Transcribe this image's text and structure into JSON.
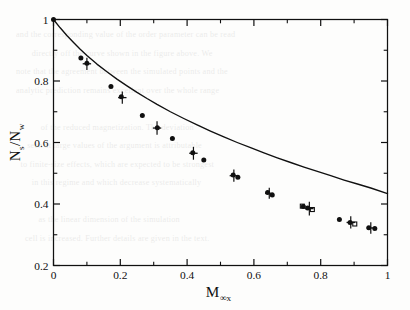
{
  "figure": {
    "background_color": "#fdfdfc",
    "ink_color": "#101010"
  },
  "ghost_text": "and the corresponding value of the order parameter can be read\n       directly off the curve shown in the figure above. We\nnote that the agreement between the simulated points and the\nanalytic prediction remains excellent over the whole range\n\n           of the reduced magnetization. The deviation\n     seen at large values of the argument is attributable\n  to finite-size effects, which are expected to be strongest\n       in this regime and which decrease systematically\n\n          as the linear dimension of the simulation\n    cell is increased. Further details are given in the text.",
  "chart_data": {
    "type": "line",
    "title": "",
    "xlabel": "M",
    "xlabel_sub": "∞x",
    "ylabel_numerator": "N",
    "ylabel_numerator_sub": "s",
    "ylabel_denominator": "N",
    "ylabel_denominator_sub": "w",
    "ylabel_full": "N_s/N_w",
    "xlim": [
      0,
      1
    ],
    "ylim": [
      0.2,
      1.0
    ],
    "x_major_ticks": [
      0,
      0.2,
      0.4,
      0.6,
      0.8,
      1
    ],
    "x_major_tick_labels": [
      "0",
      "0.2",
      "0.4",
      "0.6",
      "0.8",
      "1"
    ],
    "x_minor_ticks": [
      0.1,
      0.3,
      0.5,
      0.7,
      0.9
    ],
    "y_major_ticks": [
      0.2,
      0.4,
      0.6,
      0.8,
      1
    ],
    "y_major_tick_labels": [
      "0.2",
      "0.4",
      "0.6",
      "0.8",
      "1"
    ],
    "y_minor_ticks": [
      0.3,
      0.5,
      0.7,
      0.9
    ],
    "grid": false,
    "legend": null,
    "line_color": "#101010",
    "marker_color": "#101010",
    "series": [
      {
        "name": "theoretical-curve",
        "type": "line",
        "style": "solid",
        "x": [
          0.0,
          0.02,
          0.04,
          0.06,
          0.08,
          0.1,
          0.13,
          0.16,
          0.19,
          0.22,
          0.25,
          0.28,
          0.31,
          0.35,
          0.39,
          0.43,
          0.47,
          0.51,
          0.55,
          0.59,
          0.63,
          0.67,
          0.71,
          0.75,
          0.79,
          0.83,
          0.87,
          0.91,
          0.95,
          1.0
        ],
        "y": [
          1.0,
          0.973,
          0.948,
          0.925,
          0.903,
          0.883,
          0.855,
          0.83,
          0.806,
          0.784,
          0.763,
          0.743,
          0.724,
          0.7,
          0.678,
          0.657,
          0.637,
          0.618,
          0.6,
          0.583,
          0.566,
          0.55,
          0.535,
          0.52,
          0.506,
          0.492,
          0.478,
          0.465,
          0.452,
          0.434
        ]
      },
      {
        "name": "filled-circles",
        "type": "scatter",
        "marker": "filled-circle",
        "points": [
          {
            "x": 0.0,
            "y": 1.0
          },
          {
            "x": 0.082,
            "y": 0.875
          },
          {
            "x": 0.1,
            "y": 0.858
          },
          {
            "x": 0.172,
            "y": 0.782
          },
          {
            "x": 0.203,
            "y": 0.749
          },
          {
            "x": 0.266,
            "y": 0.688
          },
          {
            "x": 0.311,
            "y": 0.648
          },
          {
            "x": 0.356,
            "y": 0.613
          },
          {
            "x": 0.417,
            "y": 0.567
          },
          {
            "x": 0.45,
            "y": 0.543
          },
          {
            "x": 0.538,
            "y": 0.494
          },
          {
            "x": 0.552,
            "y": 0.487
          },
          {
            "x": 0.641,
            "y": 0.437
          },
          {
            "x": 0.655,
            "y": 0.429
          },
          {
            "x": 0.748,
            "y": 0.392
          },
          {
            "x": 0.761,
            "y": 0.387
          },
          {
            "x": 0.856,
            "y": 0.35
          },
          {
            "x": 0.888,
            "y": 0.34
          },
          {
            "x": 0.944,
            "y": 0.323
          },
          {
            "x": 0.962,
            "y": 0.32
          }
        ]
      },
      {
        "name": "plus-markers-with-error-bars",
        "type": "scatter",
        "marker": "plus",
        "points": [
          {
            "x": 0.1,
            "y": 0.856,
            "yerr": 0.02
          },
          {
            "x": 0.206,
            "y": 0.746,
            "yerr": 0.02
          },
          {
            "x": 0.31,
            "y": 0.647,
            "yerr": 0.022
          },
          {
            "x": 0.419,
            "y": 0.565,
            "yerr": 0.021
          },
          {
            "x": 0.54,
            "y": 0.492,
            "yerr": 0.02
          },
          {
            "x": 0.646,
            "y": 0.435,
            "yerr": 0.018
          },
          {
            "x": 0.766,
            "y": 0.385,
            "yerr": 0.022
          },
          {
            "x": 0.89,
            "y": 0.34,
            "yerr": 0.02
          },
          {
            "x": 0.95,
            "y": 0.322,
            "yerr": 0.019
          }
        ]
      },
      {
        "name": "open-squares",
        "type": "scatter",
        "marker": "open-square",
        "points": [
          {
            "x": 0.745,
            "y": 0.393
          },
          {
            "x": 0.775,
            "y": 0.382
          },
          {
            "x": 0.902,
            "y": 0.335
          }
        ]
      }
    ]
  }
}
